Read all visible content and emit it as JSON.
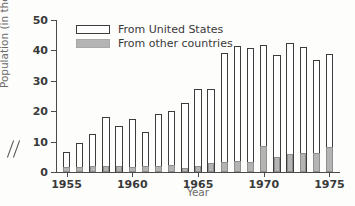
{
  "chart_data": {
    "type": "bar",
    "title": "",
    "xlabel": "Year",
    "ylabel": "Population (in thousands)",
    "ylim": [
      0,
      50
    ],
    "yticks": [
      0,
      10,
      20,
      30,
      40,
      50
    ],
    "xlim": [
      1954.2,
      1975.8
    ],
    "xticks": [
      1955,
      1960,
      1965,
      1970,
      1975
    ],
    "xtick_labels": [
      "1955",
      "1960",
      "1965",
      "1970",
      "1975"
    ],
    "grid": false,
    "axis_break": true,
    "legend_position": "top-left",
    "categories": [
      1955,
      1956,
      1957,
      1958,
      1959,
      1960,
      1961,
      1962,
      1963,
      1964,
      1965,
      1966,
      1967,
      1968,
      1969,
      1970,
      1971,
      1972,
      1973,
      1974,
      1975
    ],
    "series": [
      {
        "name": "From United States",
        "color": "#ffffff",
        "edge_color": "#3c3c3c",
        "values": [
          6.5,
          9.5,
          12.5,
          18.0,
          15.0,
          17.3,
          13.3,
          19.0,
          20.0,
          22.8,
          27.3,
          27.3,
          39.2,
          41.3,
          40.8,
          41.8,
          38.5,
          42.5,
          41.0,
          37.0,
          38.7
        ]
      },
      {
        "name": "From other countries",
        "color": "#b4b4b4",
        "edge_color": "#8e8e8e",
        "values": [
          1.6,
          1.5,
          2.0,
          1.9,
          2.1,
          1.5,
          1.9,
          2.1,
          2.2,
          1.4,
          1.9,
          2.9,
          3.4,
          3.5,
          3.2,
          8.4,
          5.1,
          5.8,
          6.1,
          6.1,
          8.3
        ]
      }
    ]
  },
  "legend": {
    "items": [
      {
        "label": "From United States"
      },
      {
        "label": "From other countries"
      }
    ]
  },
  "axes": {
    "y_title": "Population (in thousands)",
    "x_title": "Year"
  }
}
